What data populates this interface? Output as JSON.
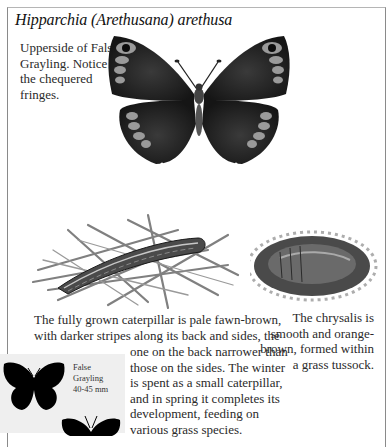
{
  "page": {
    "title": "Hipparchia (Arethusana) arethusa",
    "colors": {
      "background": "#ffffff",
      "frame": "#8a8a8a",
      "scale_box": "#efefef",
      "text": "#2a2a2a"
    }
  },
  "figures": {
    "adult_upperside": {
      "caption": "Upperside of False Grayling. Notice the chequered fringes.",
      "icon": "butterfly-illustration"
    },
    "caterpillar": {
      "caption_line1": "The fully grown caterpillar is pale fawn-brown,",
      "caption_line2": "with darker stripes along its back and sides, the",
      "caption_rest": "one on the back narrower than those on the sides. The winter is spent as a small caterpillar, and in spring it completes its development, feeding on various grass species.",
      "icon": "caterpillar-illustration"
    },
    "chrysalis": {
      "caption": "The chrysalis is smooth and orange-brown, formed within a grass tussock.",
      "icon": "chrysalis-illustration"
    }
  },
  "scale_box": {
    "name_line1": "False",
    "name_line2": "Grayling",
    "size": "40-45 mm",
    "icons": [
      "butterfly-silhouette-female",
      "butterfly-silhouette-male"
    ]
  }
}
